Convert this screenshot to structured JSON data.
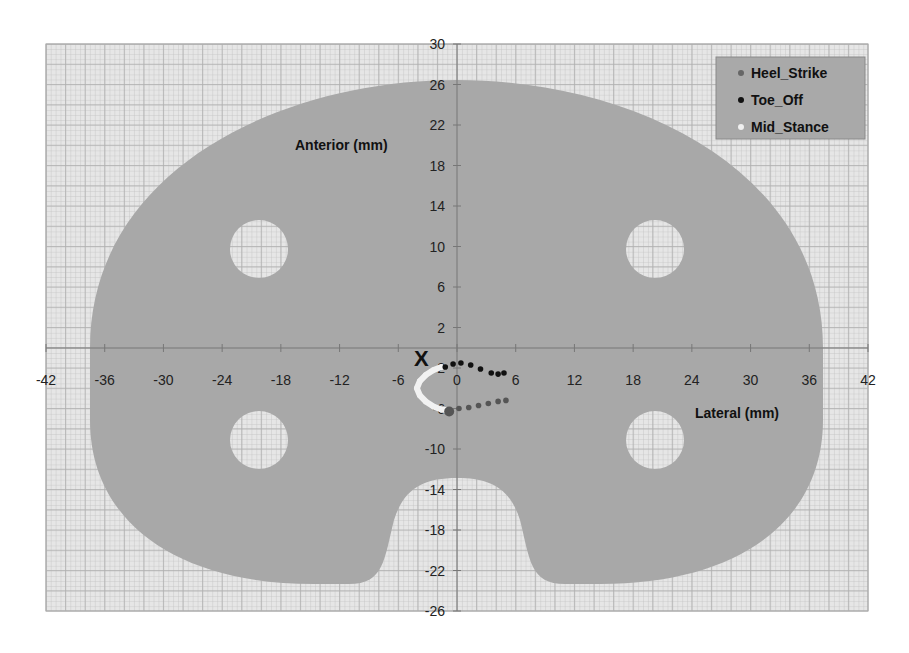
{
  "chart_data": {
    "type": "scatter",
    "title": "",
    "xlabel": "Lateral (mm)",
    "ylabel": "Anterior (mm)",
    "xlim": [
      -42,
      42
    ],
    "ylim": [
      -26,
      30
    ],
    "x_ticks": [
      -42,
      -36,
      -30,
      -24,
      -18,
      -12,
      -6,
      0,
      6,
      12,
      18,
      24,
      30,
      36,
      42
    ],
    "y_ticks": [
      30,
      26,
      22,
      18,
      14,
      10,
      6,
      2,
      -2,
      -6,
      -10,
      -14,
      -18,
      -22,
      -26
    ],
    "grid": true,
    "legend_position": "upper right",
    "origin_marker": "X",
    "series": [
      {
        "name": "Heel_Strike",
        "color": "#555555",
        "points": [
          [
            -0.8,
            -6.3
          ],
          [
            0.2,
            -6.0
          ],
          [
            1.2,
            -5.9
          ],
          [
            2.2,
            -5.7
          ],
          [
            3.2,
            -5.5
          ],
          [
            4.2,
            -5.3
          ],
          [
            5.0,
            -5.2
          ]
        ]
      },
      {
        "name": "Toe_Off",
        "color": "#111111",
        "points": [
          [
            -1.2,
            -1.9
          ],
          [
            -0.4,
            -1.6
          ],
          [
            0.4,
            -1.5
          ],
          [
            1.4,
            -1.7
          ],
          [
            2.4,
            -2.1
          ],
          [
            3.5,
            -2.5
          ],
          [
            4.2,
            -2.6
          ],
          [
            4.8,
            -2.5
          ]
        ]
      },
      {
        "name": "Mid_Stance",
        "color": "#f2f2f2",
        "points": [
          [
            -1.6,
            -1.9
          ],
          [
            -2.4,
            -2.2
          ],
          [
            -3.2,
            -2.7
          ],
          [
            -3.8,
            -3.3
          ],
          [
            -4.1,
            -4.0
          ],
          [
            -3.8,
            -4.7
          ],
          [
            -3.2,
            -5.3
          ],
          [
            -2.4,
            -5.8
          ],
          [
            -1.6,
            -6.1
          ],
          [
            -0.8,
            -6.2
          ]
        ]
      }
    ],
    "background_shape": {
      "description": "Tibial tray outline with four circular holes and posterior notch",
      "fill": "#a9a9a9",
      "holes": [
        [
          -20.5,
          10
        ],
        [
          20.5,
          10
        ],
        [
          -20.5,
          -9
        ],
        [
          20.5,
          -9
        ]
      ],
      "hole_radius_mm": 3
    }
  },
  "labels": {
    "anterior": "Anterior (mm)",
    "lateral": "Lateral (mm)",
    "origin": "X"
  },
  "legend": {
    "items": [
      {
        "label": "Heel_Strike",
        "color": "#666666"
      },
      {
        "label": "Toe_Off",
        "color": "#111111"
      },
      {
        "label": "Mid_Stance",
        "color": "#f0f0f0"
      }
    ]
  },
  "colors": {
    "grid_bg": "#e4e4e4",
    "grid_line": "#b8b8b8",
    "shape_fill": "#a8a8a8",
    "axis_line": "#777777"
  }
}
